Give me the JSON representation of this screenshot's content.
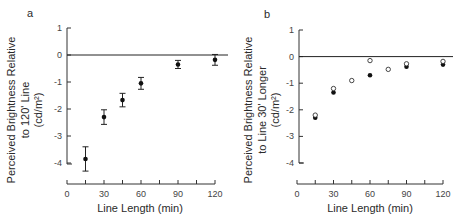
{
  "chart_data": [
    {
      "panel": "a",
      "type": "scatter",
      "xlabel": "Line Length (min)",
      "ylabel_lines": [
        "Perceived Brightness Relative",
        "to 120' Line",
        "(cd/m²)"
      ],
      "xlim": [
        0,
        120
      ],
      "ylim": [
        -4.5,
        1
      ],
      "x_ticks": [
        0,
        30,
        60,
        90,
        120
      ],
      "x_minor_ticks": [
        15,
        45,
        75,
        105
      ],
      "y_ticks": [
        1,
        0,
        -1,
        -2,
        -3,
        -4
      ],
      "reference_line_y": 0,
      "series": [
        {
          "name": "filled",
          "marker": "filled-circle",
          "points": [
            {
              "x": 15,
              "y": -3.85,
              "err": 0.45
            },
            {
              "x": 30,
              "y": -2.3,
              "err": 0.27
            },
            {
              "x": 45,
              "y": -1.67,
              "err": 0.25
            },
            {
              "x": 60,
              "y": -1.05,
              "err": 0.22
            },
            {
              "x": 90,
              "y": -0.35,
              "err": 0.15
            },
            {
              "x": 120,
              "y": -0.18,
              "err": 0.2
            }
          ]
        }
      ]
    },
    {
      "panel": "b",
      "type": "scatter",
      "xlabel": "Line Length (min)",
      "ylabel_lines": [
        "Perceived Brightness Relative",
        "to Line 30' Longer",
        "(cd/m²)"
      ],
      "xlim": [
        0,
        120
      ],
      "ylim": [
        -4,
        1
      ],
      "x_ticks": [
        0,
        30,
        60,
        90,
        120
      ],
      "x_minor_ticks": [
        15,
        45,
        75,
        105
      ],
      "y_ticks": [
        1,
        0,
        -1,
        -2,
        -3,
        -4
      ],
      "reference_line_y": 0,
      "series": [
        {
          "name": "filled",
          "marker": "filled-circle",
          "points": [
            {
              "x": 15,
              "y": -2.3
            },
            {
              "x": 30,
              "y": -1.35
            },
            {
              "x": 60,
              "y": -0.7
            },
            {
              "x": 90,
              "y": -0.38
            },
            {
              "x": 120,
              "y": -0.3
            }
          ]
        },
        {
          "name": "open",
          "marker": "open-circle",
          "points": [
            {
              "x": 15,
              "y": -2.2
            },
            {
              "x": 30,
              "y": -1.2
            },
            {
              "x": 45,
              "y": -0.9
            },
            {
              "x": 60,
              "y": -0.15
            },
            {
              "x": 75,
              "y": -0.48
            },
            {
              "x": 90,
              "y": -0.27
            },
            {
              "x": 120,
              "y": -0.18
            }
          ]
        }
      ]
    }
  ],
  "labels": {
    "panel_a": "a",
    "panel_b": "b",
    "xlabel_a": "Line Length (min)",
    "xlabel_b": "Line Length (min)",
    "ylabel_a_1": "Perceived Brightness Relative",
    "ylabel_a_2": "to 120' Line",
    "ylabel_a_3": "(cd/m²)",
    "ylabel_b_1": "Perceived Brightness Relative",
    "ylabel_b_2": "to Line 30' Longer",
    "ylabel_b_3": "(cd/m²)"
  }
}
